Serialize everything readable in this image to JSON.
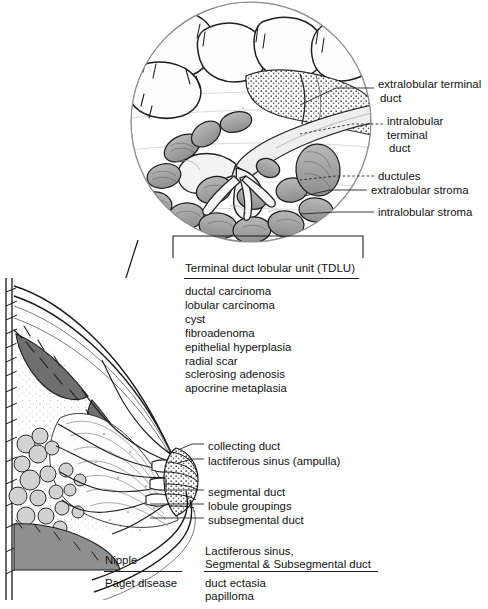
{
  "figure": {
    "ink_color": "#1a1a1a",
    "background_color": "#ffffff"
  },
  "magnified_inset": {
    "shape": "circle",
    "callouts": [
      {
        "id": "extralobular-terminal-duct",
        "line1": "extralobular terminal",
        "line2": "duct"
      },
      {
        "id": "intralobular-terminal-duct",
        "line1": "intralobular terminal",
        "line2": "duct"
      },
      {
        "id": "ductules",
        "line1": "ductules"
      },
      {
        "id": "extralobular-stroma",
        "line1": "extralobular stroma"
      },
      {
        "id": "intralobular-stroma",
        "line1": "intralobular stroma"
      }
    ]
  },
  "tdlu": {
    "caption": "Terminal duct lobular unit (TDLU)",
    "lesions": [
      "ductal carcinoma",
      "lobular carcinoma",
      "cyst",
      "fibroadenoma",
      "epithelial hyperplasia",
      "radial scar",
      "sclerosing adenosis",
      "apocrine metaplasia"
    ]
  },
  "duct_system": {
    "callouts": [
      {
        "id": "collecting-duct",
        "label": "collecting duct"
      },
      {
        "id": "lactiferous-sinus",
        "label": "lactiferous sinus (ampulla)"
      },
      {
        "id": "segmental-duct",
        "label": "segmental duct"
      },
      {
        "id": "lobule-groupings",
        "label": "lobule groupings"
      },
      {
        "id": "subsegmental-duct",
        "label": "subsegmental duct"
      }
    ]
  },
  "comparison_table": {
    "left": {
      "header": "Nipple",
      "entries": [
        "Paget disease"
      ]
    },
    "right": {
      "header_line1": "Lactiferous sinus,",
      "header_line2": "Segmental & Subsegmental duct",
      "entries": [
        "duct ectasia",
        "papilloma"
      ]
    }
  }
}
